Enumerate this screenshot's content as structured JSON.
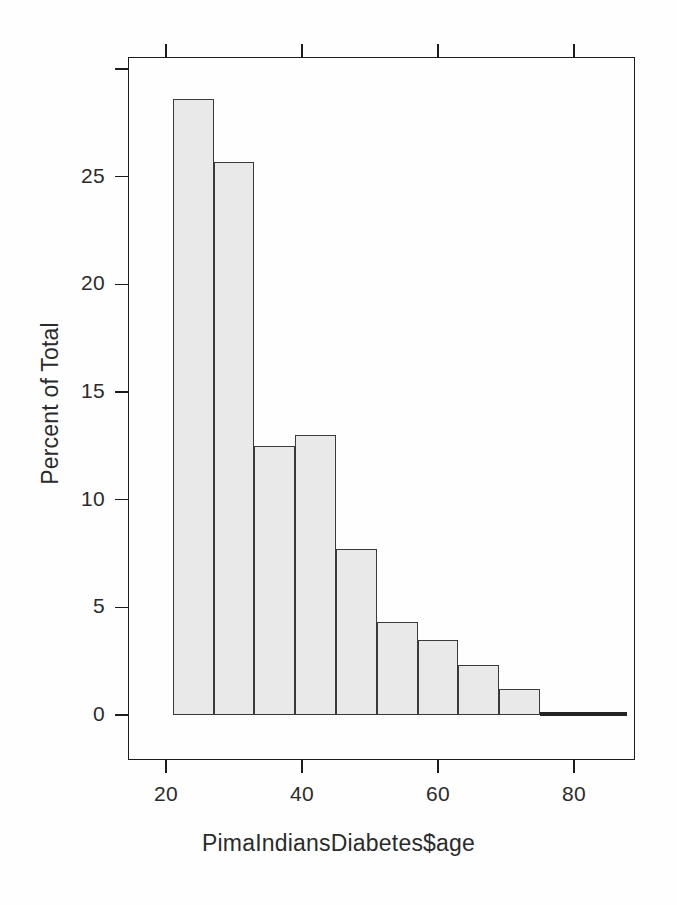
{
  "chart_data": {
    "type": "bar",
    "title": "",
    "subtitle": "",
    "xlabel": "PimaIndiansDiabetes$age",
    "ylabel": "Percent of Total",
    "xlim": [
      15,
      89
    ],
    "ylim": [
      0,
      30
    ],
    "grid": false,
    "legend": null,
    "bin_width": 6,
    "bin_edges": [
      21,
      27,
      33,
      39,
      45,
      51,
      57,
      63,
      69,
      75,
      81
    ],
    "categories": [
      "21-27",
      "27-33",
      "33-39",
      "39-45",
      "45-51",
      "51-57",
      "57-63",
      "63-69",
      "69-75",
      "75-81"
    ],
    "bin_centers": [
      24,
      30,
      36,
      42,
      48,
      54,
      60,
      66,
      72,
      78
    ],
    "values": [
      28.6,
      25.7,
      12.5,
      13.0,
      7.7,
      4.3,
      3.5,
      2.3,
      1.2,
      0.1
    ],
    "x_ticks": [
      20,
      40,
      60,
      80
    ],
    "x_tick_labels": [
      "20",
      "40",
      "60",
      "80"
    ],
    "y_ticks": [
      0,
      5,
      10,
      15,
      20,
      25,
      30
    ],
    "y_tick_labels": [
      "0",
      "5",
      "10",
      "15",
      "20",
      "25",
      ""
    ],
    "bar_fill_color": "#e9e9e9",
    "bar_border_color": "#3a3a3a",
    "axis_color": "#1d1d1d",
    "background_color": "#ffffff"
  }
}
